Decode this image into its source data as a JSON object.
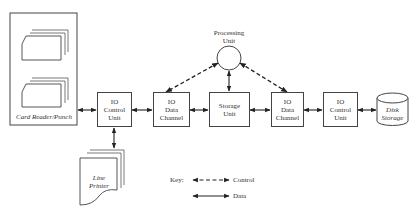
{
  "diagram": {
    "card_reader": {
      "label": "Card Reader/Punch"
    },
    "line_printer": {
      "label": "Line Printer"
    },
    "io_control_unit_1": {
      "line1": "IO",
      "line2": "Control",
      "line3": "Unit"
    },
    "io_data_channel_1": {
      "line1": "IO",
      "line2": "Data",
      "line3": "Channel"
    },
    "processing_unit": {
      "line1": "Processing",
      "line2": "Unit"
    },
    "storage_unit": {
      "line1": "Storage",
      "line2": "Unit"
    },
    "io_data_channel_2": {
      "line1": "IO",
      "line2": "Data",
      "line3": "Channel"
    },
    "io_control_unit_2": {
      "line1": "IO",
      "line2": "Control",
      "line3": "Unit"
    },
    "disk_storage": {
      "line1": "Disk",
      "line2": "Storage"
    },
    "key": {
      "title": "Key:",
      "control_label": "Control",
      "data_label": "Data"
    }
  }
}
